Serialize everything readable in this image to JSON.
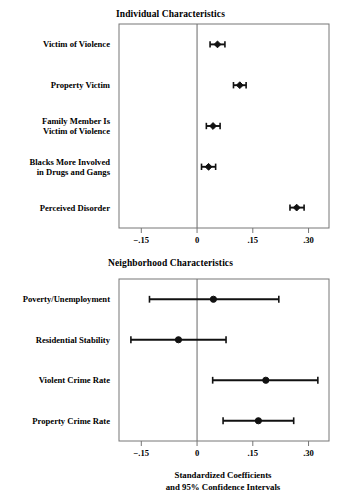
{
  "figure": {
    "axis_caption_line1": "Standardized Coefficients",
    "axis_caption_line2": "and 95% Confidence Intervals"
  },
  "chart_data": [
    {
      "type": "scatter",
      "title": "Individual Characteristics",
      "xlabel": "Standardized Coefficients and 95% Confidence Intervals",
      "ylabel": "",
      "xlim": [
        -0.21,
        0.355
      ],
      "xticks": [
        -0.15,
        0,
        0.15,
        0.3
      ],
      "xticklabels": [
        "−.15",
        "0",
        ".15",
        ".30"
      ],
      "grid": false,
      "zero_reference_line": 0,
      "categories": [
        "Victim of Violence",
        "Property Victim",
        "Family Member Is\nVictim of Violence",
        "Blacks More Involved\nin Drugs and Gangs",
        "Perceived Disorder"
      ],
      "points": [
        {
          "label": "Victim of Violence",
          "estimate": 0.055,
          "ci_low": 0.035,
          "ci_high": 0.075
        },
        {
          "label": "Property Victim",
          "estimate": 0.115,
          "ci_low": 0.098,
          "ci_high": 0.132
        },
        {
          "label": "Family Member Is Victim of Violence",
          "estimate": 0.043,
          "ci_low": 0.025,
          "ci_high": 0.062
        },
        {
          "label": "Blacks More Involved in Drugs and Gangs",
          "estimate": 0.031,
          "ci_low": 0.012,
          "ci_high": 0.05
        },
        {
          "label": "Perceived Disorder",
          "estimate": 0.268,
          "ci_low": 0.25,
          "ci_high": 0.288
        }
      ]
    },
    {
      "type": "scatter",
      "title": "Neighborhood Characteristics",
      "xlabel": "Standardized Coefficients and 95% Confidence Intervals",
      "ylabel": "",
      "xlim": [
        -0.21,
        0.355
      ],
      "xticks": [
        -0.15,
        0,
        0.15,
        0.3
      ],
      "xticklabels": [
        "−.15",
        "0",
        ".15",
        ".30"
      ],
      "grid": false,
      "zero_reference_line": 0,
      "categories": [
        "Poverty/Unemployment",
        "Residential Stability",
        "Violent Crime Rate",
        "Property Crime Rate"
      ],
      "points": [
        {
          "label": "Poverty/Unemployment",
          "estimate": 0.044,
          "ci_low": -0.128,
          "ci_high": 0.22
        },
        {
          "label": "Residential Stability",
          "estimate": -0.05,
          "ci_low": -0.178,
          "ci_high": 0.078
        },
        {
          "label": "Violent Crime Rate",
          "estimate": 0.185,
          "ci_low": 0.042,
          "ci_high": 0.325
        },
        {
          "label": "Property Crime Rate",
          "estimate": 0.165,
          "ci_low": 0.07,
          "ci_high": 0.26
        }
      ]
    }
  ]
}
